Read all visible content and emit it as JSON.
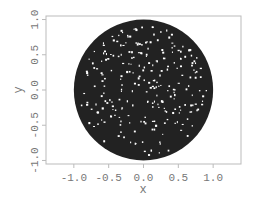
{
  "chart_data": {
    "type": "scatter",
    "title": "",
    "xlabel": "x",
    "ylabel": "y",
    "xlim": [
      -1.4,
      1.4
    ],
    "ylim": [
      -1.05,
      1.05
    ],
    "xticks": [
      "-1.0",
      "-0.5",
      "0.0",
      "0.5",
      "1.0"
    ],
    "yticks": [
      "-1.0",
      "-0.5",
      "0.0",
      "0.5",
      "1.0"
    ],
    "grid": false,
    "legend": null,
    "series": [
      {
        "name": "points",
        "shape": "unit disk",
        "center": [
          0,
          0
        ],
        "radius": 1.0,
        "color": "#222222"
      }
    ]
  }
}
